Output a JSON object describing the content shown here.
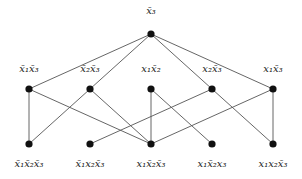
{
  "diagram": {
    "type": "hasse-lattice",
    "accent_color": "#111111",
    "edge_color": "#555555",
    "nodes": {
      "top": {
        "id": "T",
        "x": 151,
        "y": 34,
        "label": "x̄₃",
        "label_y": 6
      },
      "middle": [
        {
          "id": "M1",
          "x": 29,
          "y": 89,
          "label": "x̄₁x̄₃",
          "label_y": 64
        },
        {
          "id": "M2",
          "x": 90,
          "y": 89,
          "label": "x̄₂x̄₃",
          "label_y": 64
        },
        {
          "id": "M3",
          "x": 151,
          "y": 89,
          "label": "x₁x̄₂",
          "label_y": 64
        },
        {
          "id": "M4",
          "x": 212,
          "y": 89,
          "label": "x₂x̄₃",
          "label_y": 64
        },
        {
          "id": "M5",
          "x": 273,
          "y": 89,
          "label": "x₁x̄₃",
          "label_y": 64
        }
      ],
      "bottom": [
        {
          "id": "B1",
          "x": 29,
          "y": 144,
          "label": "x̄₁x̄₂x̄₃",
          "label_y": 159
        },
        {
          "id": "B2",
          "x": 90,
          "y": 144,
          "label": "x̄₁x₂x̄₃",
          "label_y": 159
        },
        {
          "id": "B3",
          "x": 151,
          "y": 144,
          "label": "x₁x̄₂x̄₃",
          "label_y": 159
        },
        {
          "id": "B4",
          "x": 212,
          "y": 144,
          "label": "x₁x̄₂x₃",
          "label_y": 159
        },
        {
          "id": "B5",
          "x": 273,
          "y": 144,
          "label": "x₁x₂x̄₃",
          "label_y": 159
        }
      ]
    },
    "edges": [
      [
        "T",
        "M1"
      ],
      [
        "T",
        "M2"
      ],
      [
        "T",
        "M4"
      ],
      [
        "T",
        "M5"
      ],
      [
        "M1",
        "B1"
      ],
      [
        "M1",
        "B3"
      ],
      [
        "M2",
        "B1"
      ],
      [
        "M2",
        "B3"
      ],
      [
        "M3",
        "B3"
      ],
      [
        "M3",
        "B4"
      ],
      [
        "M4",
        "B2"
      ],
      [
        "M4",
        "B5"
      ],
      [
        "M5",
        "B3"
      ],
      [
        "M5",
        "B5"
      ]
    ]
  }
}
